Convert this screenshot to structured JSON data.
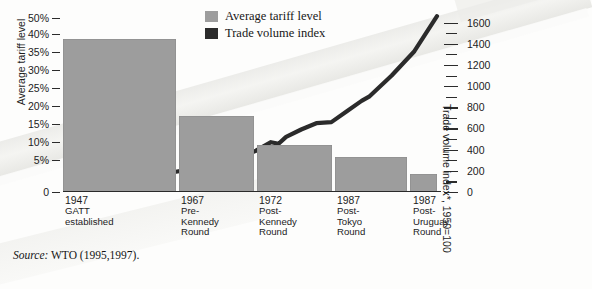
{
  "legend": {
    "position": "top-center",
    "items": [
      {
        "label": "Average tariff level",
        "color": "#9d9d9d",
        "series": "bars"
      },
      {
        "label": "Trade volume index",
        "color": "#2b2b2b",
        "series": "line"
      }
    ]
  },
  "axes": {
    "left": {
      "title": "Average tariff level",
      "ticks": [
        "50%",
        "40%",
        "35%",
        "30%",
        "25%",
        "20%",
        "15%",
        "10%",
        "5%",
        "0"
      ]
    },
    "right": {
      "title": "Trade volume index*, 1950=100",
      "ticks": [
        "1600",
        "1400",
        "1200",
        "1000",
        "800",
        "600",
        "400",
        "200",
        "0"
      ]
    }
  },
  "source": {
    "label": "Source:",
    "text": "WTO (1995,1997)."
  },
  "categories": [
    {
      "year": "1947",
      "detail": "GATT\nestablished"
    },
    {
      "year": "1967",
      "detail": "Pre-\nKennedy\nRound"
    },
    {
      "year": "1972",
      "detail": "Post-\nKennedy\nRound"
    },
    {
      "year": "1987",
      "detail": "Post-\nTokyo\nRound"
    },
    {
      "year": "1987",
      "detail": "Post-\nUruguay\nRound"
    }
  ],
  "chart_data": {
    "type": "bar",
    "title": "",
    "subtitle": "",
    "xlabel": "",
    "ylabel": "Average tariff level",
    "y2label": "Trade volume index*, 1950=100",
    "grid": false,
    "legend_position": "top-center",
    "categories": [
      "1947 GATT established",
      "1967 Pre-Kennedy Round",
      "1972 Post-Kennedy Round",
      "1987 Post-Tokyo Round",
      "1987 Post-Uruguay Round"
    ],
    "ylim": [
      0,
      50
    ],
    "ytick_values": [
      50,
      40,
      35,
      30,
      25,
      20,
      15,
      10,
      5,
      0
    ],
    "ytick_labels": [
      "50%",
      "40%",
      "35%",
      "30%",
      "25%",
      "20%",
      "15%",
      "10%",
      "5%",
      "0"
    ],
    "y2lim": [
      0,
      1700
    ],
    "y2tick_values": [
      1600,
      1400,
      1200,
      1000,
      800,
      600,
      400,
      200,
      0
    ],
    "series": [
      {
        "name": "Average tariff level",
        "type": "bar",
        "axis": "left",
        "unit": "percent",
        "color": "#9d9d9d",
        "values": [
          39,
          17.5,
          9.5,
          6,
          3
        ]
      },
      {
        "name": "Trade volume index",
        "type": "line",
        "axis": "right",
        "unit": "index, 1950=100",
        "color": "#2b2b2b",
        "x": [
          1950,
          1955,
          1960,
          1965,
          1967,
          1970,
          1972,
          1974,
          1975,
          1976,
          1978,
          1980,
          1982,
          1984,
          1986,
          1987,
          1990,
          1993,
          1996
        ],
        "values": [
          100,
          130,
          175,
          235,
          270,
          330,
          390,
          470,
          455,
          520,
          590,
          650,
          660,
          760,
          860,
          900,
          1100,
          1330,
          1660
        ]
      }
    ],
    "annotations": [
      "* index, 1950=100"
    ]
  }
}
